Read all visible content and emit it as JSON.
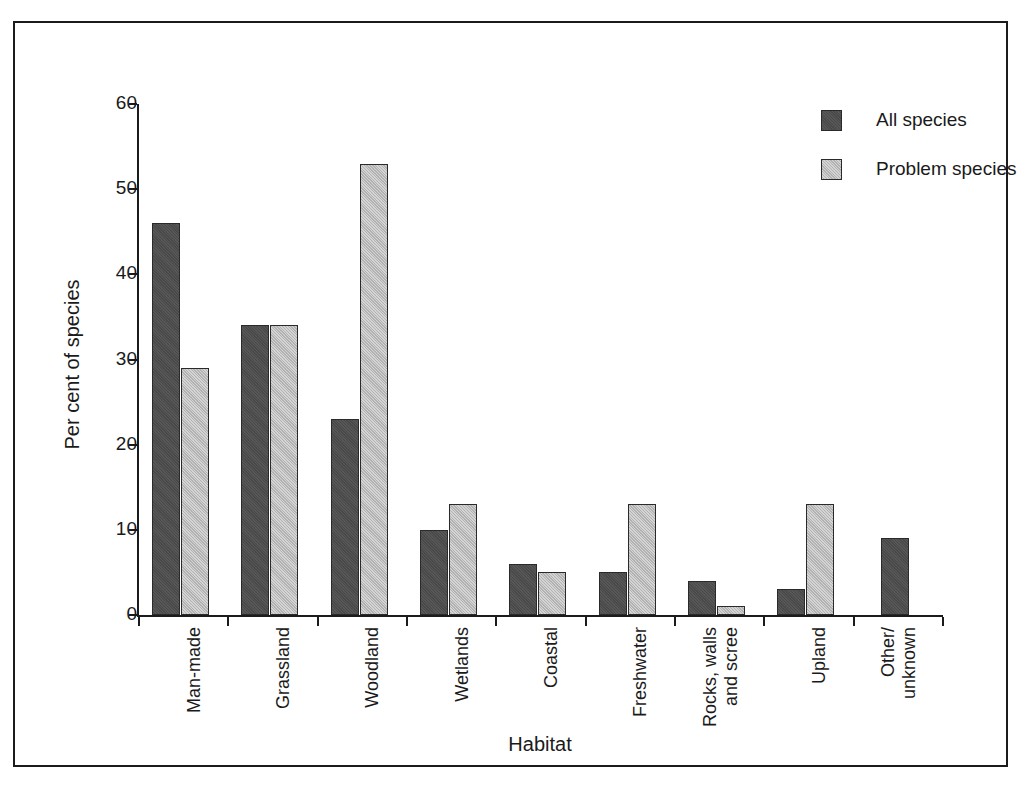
{
  "chart_data": {
    "type": "bar",
    "title": "",
    "xlabel": "Habitat",
    "ylabel": "Per cent of species",
    "ylim": [
      0,
      60
    ],
    "yticks": [
      0,
      10,
      20,
      30,
      40,
      50,
      60
    ],
    "ytick_labels": [
      "0",
      "10",
      "20",
      "30",
      "40",
      "50",
      "60"
    ],
    "grid": false,
    "legend_position": "top-right",
    "categories": [
      "Man-made",
      "Grassland",
      "Woodland",
      "Wetlands",
      "Coastal",
      "Freshwater",
      "Rocks, walls\nand scree",
      "Upland",
      "Other/\nunknown"
    ],
    "series": [
      {
        "name": "All species",
        "color": "#4d4d4d",
        "values": [
          46,
          34,
          23,
          10,
          6,
          5,
          4,
          3,
          9
        ]
      },
      {
        "name": "Problem species",
        "color": "#bdbdbd",
        "values": [
          29,
          34,
          53,
          13,
          5,
          13,
          1,
          13,
          null
        ]
      }
    ]
  },
  "legend": {
    "items": [
      {
        "label": "All species",
        "swatch": "series-all"
      },
      {
        "label": "Problem species",
        "swatch": "series-problem"
      }
    ]
  },
  "colors": {
    "all_species": "#4d4d4d",
    "problem_species": "#bdbdbd",
    "axis": "#1b1b1b",
    "frame": "#1b1b1b",
    "background": "#ffffff"
  }
}
